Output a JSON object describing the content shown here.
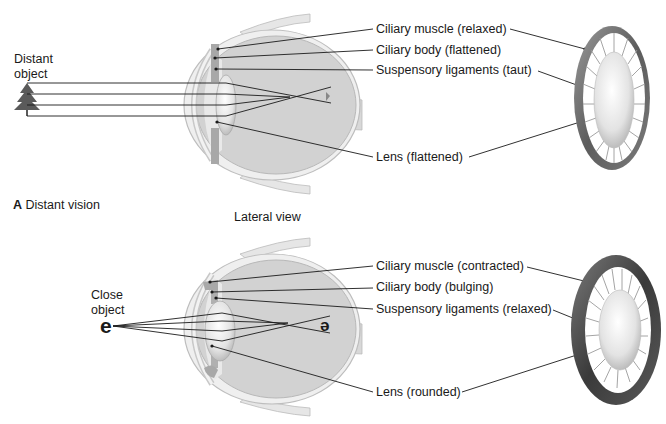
{
  "panel_a": {
    "letter": "A",
    "title": "Distant vision",
    "object_label_line1": "Distant",
    "object_label_line2": "object",
    "labels": [
      "Ciliary muscle (relaxed)",
      "Ciliary body (flattened)",
      "Suspensory ligaments (taut)",
      "Lens (flattened)"
    ]
  },
  "panel_b": {
    "view_label": "Lateral view",
    "object_label_line1": "Close",
    "object_label_line2": "object",
    "object_glyph": "e",
    "retina_glyph": "ə",
    "labels": [
      "Ciliary muscle (contracted)",
      "Ciliary body (bulging)",
      "Suspensory ligaments (relaxed)",
      "Lens (rounded)"
    ]
  },
  "colors": {
    "line": "#1a1a1a",
    "eye_fill": "#d4d4d4",
    "eye_wall": "#bcbcbc",
    "ring": "#6e6e6e"
  }
}
